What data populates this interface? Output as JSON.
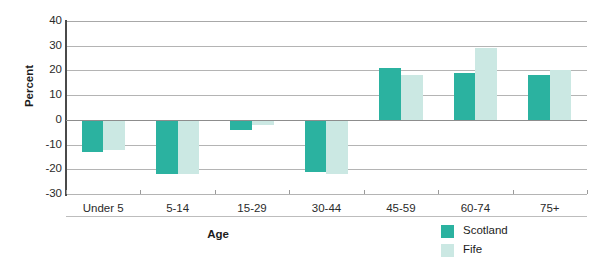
{
  "chart_data": {
    "type": "bar",
    "title": "",
    "xlabel": "Age",
    "ylabel": "Percent",
    "ylim": [
      -30,
      40
    ],
    "ytick_step": 10,
    "yticks": [
      40,
      30,
      20,
      10,
      0,
      -10,
      -20,
      -30
    ],
    "ytick_labels": [
      "40",
      "30",
      "20",
      "10",
      "0",
      "-10",
      "-20",
      "-30"
    ],
    "grid": true,
    "grid_axis": "y",
    "legend_position": "bottom-right",
    "categories": [
      "Under 5",
      "5-14",
      "15-29",
      "30-44",
      "45-59",
      "60-74",
      "75+"
    ],
    "series": [
      {
        "name": "Scotland",
        "color": "#2bb2a0",
        "values": [
          -13,
          -22,
          -4,
          -21,
          21,
          19,
          18
        ]
      },
      {
        "name": "Fife",
        "color": "#cbe8e3",
        "values": [
          -12,
          -22,
          -2,
          -22,
          18,
          29,
          20
        ]
      }
    ]
  },
  "axes": {
    "y_label": "Percent",
    "x_label": "Age"
  },
  "legend": {
    "entries": [
      {
        "label": "Scotland",
        "color": "#2bb2a0"
      },
      {
        "label": "Fife",
        "color": "#cbe8e3"
      }
    ]
  }
}
